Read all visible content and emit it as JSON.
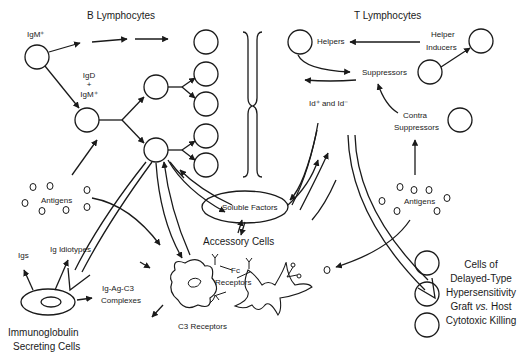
{
  "diagram": {
    "title_b": "B Lymphocytes",
    "title_t": "T Lymphocytes",
    "b_cell_labels": {
      "igm": "IgM⁺",
      "igd_line1": "IgD",
      "igd_plus": "+",
      "igd_line2": "IgM⁺"
    },
    "t_cell_labels": {
      "helpers": "Helpers",
      "helper_inducers_1": "Helper",
      "helper_inducers_2": "Inducers",
      "suppressors": "Suppressors",
      "id_label": "Id⁺ and Id⁻",
      "contra_1": "Contra",
      "contra_2": "Suppressors"
    },
    "antigens_left": "Antigens",
    "antigens_right": "Antigens",
    "soluble_factors": "Soluble Factors",
    "accessory_cells": "Accessory Cells",
    "fc_receptors_1": "Fc",
    "fc_receptors_2": "Receptors",
    "c3_receptors": "C3 Receptors",
    "igs": "Igs",
    "ig_idiotypes": "Ig Idiotypes",
    "complexes_1": "Ig-Ag-C3",
    "complexes_2": "Complexes",
    "secreting_1": "Immunoglobulin",
    "secreting_2": "Secreting Cells",
    "effector": {
      "line1": "Cells of",
      "line2": "Delayed-Type",
      "line3": "Hypersensitivity",
      "line4a": "Graft ",
      "line4b": "vs.",
      "line4c": " Host",
      "line5": "Cytotoxic Killing"
    },
    "colors": {
      "ink": "#1a1a1a",
      "background": "#ffffff"
    }
  }
}
